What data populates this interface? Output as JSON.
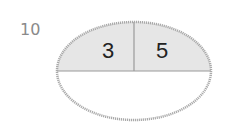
{
  "problem": {
    "number": "10"
  },
  "diagram": {
    "type": "number-bond-ellipse",
    "top_left_value": "3",
    "top_right_value": "5",
    "bottom_value": "",
    "colors": {
      "outline": "#a9a9a9",
      "top_fill": "#e6e6e6",
      "bottom_fill": "#ffffff",
      "divider": "#9a9a9a",
      "text": "#222222"
    }
  }
}
